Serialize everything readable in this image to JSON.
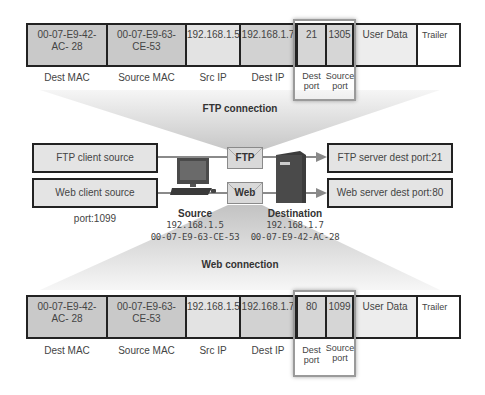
{
  "top_frame": {
    "cells": {
      "dest_mac": "00-07-E9-42-\nAC- 28",
      "dest_mac_line1": "00-07-E9-42-",
      "dest_mac_line2": "AC- 28",
      "source_mac_line1": "00-07-E9-63-",
      "source_mac_line2": "CE-53",
      "src_ip": "192.168.1.5",
      "dest_ip": "192.168.1.7",
      "dest_port": "21",
      "source_port": "1305",
      "user_data": "User Data",
      "trailer": "Trailer"
    },
    "labels": {
      "dest_mac": "Dest MAC",
      "source_mac": "Source MAC",
      "src_ip": "Src IP",
      "dest_ip": "Dest IP",
      "dest_port_1": "Dest",
      "dest_port_2": "port",
      "source_port_1": "Source",
      "source_port_2": "port"
    }
  },
  "ftp_connection": {
    "title": "FTP connection",
    "client_box": "FTP client source port:1305",
    "server_box": "FTP server dest port:21",
    "protocol_label": "FTP"
  },
  "web_connection": {
    "title": "Web connection",
    "client_box": "Web client source port:1099",
    "server_box": "Web server dest port:80",
    "protocol_label": "Web"
  },
  "source_node": {
    "title": "Source",
    "ip": "192.168.1.5",
    "mac": "00-07-E9-63-CE-53",
    "icon": "desktop-computer-icon"
  },
  "destination_node": {
    "title": "Destination",
    "ip": "192.168.1.7",
    "mac": "00-07-E9-42-AC-28",
    "icon": "server-tower-icon"
  },
  "bottom_frame": {
    "cells": {
      "dest_mac_line1": "00-07-E9-42-",
      "dest_mac_line2": "AC- 28",
      "source_mac_line1": "00-07-E9-63-",
      "source_mac_line2": "CE-53",
      "src_ip": "192.168.1.5",
      "dest_ip": "192.168.1.7",
      "dest_port": "80",
      "source_port": "1099",
      "user_data": "User Data",
      "trailer": "Trailer"
    },
    "labels": {
      "dest_mac": "Dest MAC",
      "source_mac": "Source MAC",
      "src_ip": "Src IP",
      "dest_ip": "Dest IP",
      "dest_port_1": "Dest",
      "dest_port_2": "port",
      "source_port_1": "Source",
      "source_port_2": "port"
    }
  },
  "colors": {
    "frame_border": "#222222",
    "mac_cell": "#c9c9c9",
    "ip_cell": "#e3e3e3",
    "port_box": "#e4e4e4",
    "funnel": "#cfcfcf"
  }
}
